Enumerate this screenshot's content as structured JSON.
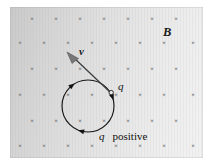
{
  "figure": {
    "background_color": "#ffffff",
    "field_fill_light": "#f2f2f2",
    "field_fill_dark": "#c9c9c9",
    "ink_color": "#151515"
  },
  "labels": {
    "field_label": "B",
    "velocity_label": "v",
    "charge_label": "q",
    "caption_symbol": "q",
    "caption_text": "positive",
    "x_mark_glyph": "×"
  },
  "field": {
    "name": "magnetic-field-into-page",
    "symbol": "B",
    "direction": "into the page",
    "marker": "×",
    "rows": 6,
    "region": {
      "x": 10,
      "y": 7,
      "width": 193,
      "height": 151
    },
    "x_marks": [
      {
        "x": 32,
        "y": 20
      },
      {
        "x": 56,
        "y": 20
      },
      {
        "x": 80,
        "y": 20
      },
      {
        "x": 104,
        "y": 20
      },
      {
        "x": 128,
        "y": 20
      },
      {
        "x": 152,
        "y": 20
      },
      {
        "x": 176,
        "y": 20
      },
      {
        "x": 20,
        "y": 44
      },
      {
        "x": 44,
        "y": 44
      },
      {
        "x": 68,
        "y": 44
      },
      {
        "x": 92,
        "y": 44
      },
      {
        "x": 116,
        "y": 44
      },
      {
        "x": 140,
        "y": 44
      },
      {
        "x": 164,
        "y": 44
      },
      {
        "x": 193,
        "y": 44
      },
      {
        "x": 32,
        "y": 70
      },
      {
        "x": 56,
        "y": 70
      },
      {
        "x": 80,
        "y": 70
      },
      {
        "x": 104,
        "y": 70
      },
      {
        "x": 128,
        "y": 70
      },
      {
        "x": 152,
        "y": 70
      },
      {
        "x": 176,
        "y": 70
      },
      {
        "x": 20,
        "y": 96
      },
      {
        "x": 44,
        "y": 96
      },
      {
        "x": 68,
        "y": 96
      },
      {
        "x": 92,
        "y": 96
      },
      {
        "x": 116,
        "y": 96
      },
      {
        "x": 140,
        "y": 96
      },
      {
        "x": 164,
        "y": 96
      },
      {
        "x": 193,
        "y": 96
      },
      {
        "x": 32,
        "y": 122
      },
      {
        "x": 56,
        "y": 122
      },
      {
        "x": 80,
        "y": 122
      },
      {
        "x": 104,
        "y": 122
      },
      {
        "x": 128,
        "y": 122
      },
      {
        "x": 152,
        "y": 122
      },
      {
        "x": 176,
        "y": 122
      },
      {
        "x": 20,
        "y": 147
      },
      {
        "x": 44,
        "y": 147
      },
      {
        "x": 68,
        "y": 147
      },
      {
        "x": 92,
        "y": 147
      },
      {
        "x": 116,
        "y": 147
      },
      {
        "x": 140,
        "y": 147
      },
      {
        "x": 164,
        "y": 147
      },
      {
        "x": 193,
        "y": 147
      }
    ]
  },
  "orbit": {
    "name": "circular-trajectory",
    "center_x": 88,
    "center_y": 106,
    "radius": 26,
    "sense": "clockwise",
    "arrow_angles_deg": [
      128,
      20,
      255
    ]
  },
  "velocity": {
    "name": "velocity-vector",
    "symbol": "v",
    "tail_x": 111,
    "tail_y": 93,
    "tip_x": 68,
    "tip_y": 52,
    "direction": "up and to the left, tangent to the circle"
  },
  "charge": {
    "name": "point-charge",
    "symbol": "q",
    "sign": "positive",
    "x": 111,
    "y": 93
  },
  "label_positions": {
    "B": {
      "x": 163,
      "y": 36
    },
    "v": {
      "x": 79,
      "y": 55
    },
    "q": {
      "x": 118,
      "y": 90
    },
    "caption": {
      "x": 99,
      "y": 140
    }
  }
}
